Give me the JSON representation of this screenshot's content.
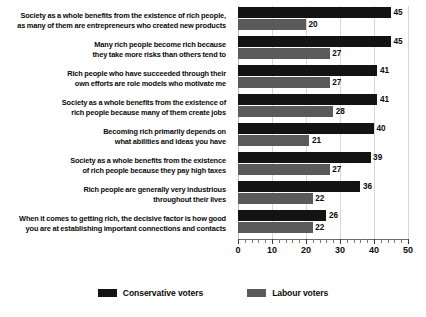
{
  "chart_data": {
    "type": "bar",
    "orientation": "horizontal",
    "title": "",
    "subtitle": "",
    "xlabel": "",
    "ylabel": "",
    "xlim": [
      0,
      50
    ],
    "xticks": [
      0,
      10,
      20,
      30,
      40,
      50
    ],
    "xtick_labels": [
      "0",
      "10",
      "20",
      "30",
      "40",
      "50"
    ],
    "minor_tick_step": 2,
    "grid": true,
    "grid_axis": "x",
    "legend_position": "bottom",
    "categories": [
      "Society as a whole benefits from the existence of rich people, as many of them are entrepreneurs who created new products",
      "Many rich people become rich because they take more risks than others tend to",
      "Rich people who have succeeded through their own efforts are role models who motivate me",
      "Society as a whole benefits from the existence of rich people because many of them create jobs",
      "Becoming rich primarily depends on what abilities and ideas you have",
      "Society as a whole benefits from the existence of rich people because they pay high taxes",
      "Rich people are generally very industrious throughout their lives",
      "When it comes to getting rich, the decisive factor is how good you are at establishing important connections and contacts"
    ],
    "category_lines": [
      [
        "Society as a whole benefits from the existence of rich people,",
        "as many of them are entrepreneurs who created new products"
      ],
      [
        "Many rich people become rich because",
        "they take more risks than others tend to"
      ],
      [
        "Rich people who have succeeded through their",
        "own efforts are role models who motivate me"
      ],
      [
        "Society as a whole benefits from the existence of",
        "rich people because many of them create jobs"
      ],
      [
        "Becoming rich primarily depends on",
        "what abilities and ideas you have"
      ],
      [
        "Society as a whole benefits from the existence",
        "of rich people because they pay high taxes"
      ],
      [
        "Rich people are generally very industrious",
        "throughout their lives"
      ],
      [
        "When it comes to getting rich, the decisive factor is how good",
        "you are at establishing important connections and contacts"
      ]
    ],
    "series": [
      {
        "name": "Conservative voters",
        "color": "#131313",
        "values": [
          45,
          45,
          41,
          41,
          40,
          39,
          36,
          26
        ]
      },
      {
        "name": "Labour voters",
        "color": "#5a5a5c",
        "values": [
          20,
          27,
          27,
          28,
          21,
          27,
          22,
          22
        ]
      }
    ]
  },
  "legend": {
    "items": [
      {
        "label": "Conservative voters",
        "color": "#131313"
      },
      {
        "label": "Labour voters",
        "color": "#5a5a5c"
      }
    ]
  }
}
